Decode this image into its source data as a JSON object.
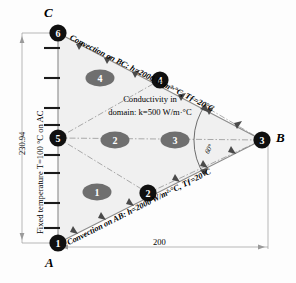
{
  "diagram": {
    "vertices": [
      {
        "name": "A",
        "label": "A",
        "x": 58,
        "y": 243
      },
      {
        "name": "B",
        "label": "B",
        "x": 262,
        "y": 140
      },
      {
        "name": "C",
        "label": "C",
        "x": 58,
        "y": 33
      }
    ],
    "nodes": [
      {
        "id": "1",
        "label": "1",
        "x": 58,
        "y": 243
      },
      {
        "id": "2",
        "label": "2",
        "x": 148,
        "y": 193
      },
      {
        "id": "3",
        "label": "3",
        "x": 262,
        "y": 140
      },
      {
        "id": "4",
        "label": "4",
        "x": 160,
        "y": 80
      },
      {
        "id": "5",
        "label": "5",
        "x": 58,
        "y": 138
      },
      {
        "id": "6",
        "label": "6",
        "x": 58,
        "y": 33
      }
    ],
    "elements": [
      {
        "id": "1",
        "label": "1",
        "x": 97,
        "y": 192
      },
      {
        "id": "2",
        "label": "2",
        "x": 115,
        "y": 140
      },
      {
        "id": "3",
        "label": "3",
        "x": 175,
        "y": 140
      },
      {
        "id": "4",
        "label": "4",
        "x": 100,
        "y": 78
      }
    ],
    "boundary_conditions": {
      "bc_top": "Convection on BC: h=2000 W/m²·°C, Tƒ=20°C",
      "bc_bottom": "Convection on AB: h=2000 W/m²·°C, Tƒ=20°C",
      "bc_left": "Fixed temperature T=100 °C on AC",
      "domain_line1": "Conductivity in",
      "domain_line2": "domain: k=500 W/m·°C"
    },
    "dimensions": {
      "vertical": "230.94",
      "horizontal": "200",
      "angle": "60°"
    },
    "colors": {
      "node_fill": "#101010",
      "element_fill": "#6f6f6f",
      "domain_fill": "#f0f0f0",
      "outline": "#8c8c8c",
      "dim_line": "#9a9a9a",
      "text": "#000000"
    }
  }
}
